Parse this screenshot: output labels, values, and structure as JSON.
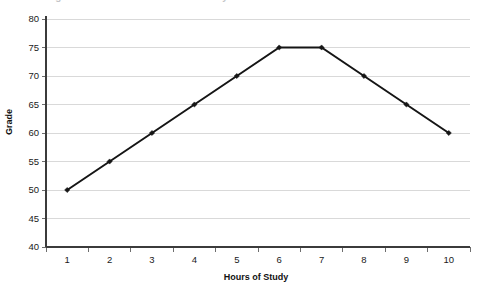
{
  "chart_data": {
    "type": "line",
    "title": "Figure: Grade versus Hours of Study",
    "xlabel": "Hours of Study",
    "ylabel": "Grade",
    "x": [
      1,
      2,
      3,
      4,
      5,
      6,
      7,
      8,
      9,
      10
    ],
    "values": [
      50,
      55,
      60,
      65,
      70,
      75,
      75,
      70,
      65,
      60
    ],
    "series": [
      {
        "name": "Grade",
        "values": [
          50,
          55,
          60,
          65,
          70,
          75,
          75,
          70,
          65,
          60
        ]
      }
    ],
    "xtick_labels": [
      "1",
      "2",
      "3",
      "4",
      "5",
      "6",
      "7",
      "8",
      "9",
      "10"
    ],
    "ytick_labels": [
      "40",
      "45",
      "50",
      "55",
      "60",
      "65",
      "70",
      "75",
      "80"
    ],
    "yticks": [
      40,
      45,
      50,
      55,
      60,
      65,
      70,
      75,
      80
    ],
    "ylim": [
      40,
      80
    ],
    "xlim": [
      0.5,
      10.5
    ],
    "grid": "horizontal",
    "legend": "none",
    "line_color": "#151515",
    "grid_color": "#d9d9d9",
    "axis_color": "#3b3b3b",
    "background_color": "#ffffff",
    "marker": "diamond"
  }
}
